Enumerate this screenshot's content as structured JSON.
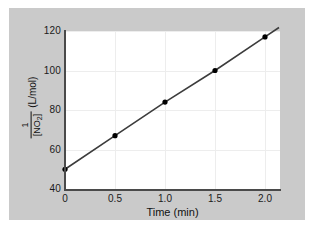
{
  "chart_data": {
    "type": "line",
    "title": "",
    "xlabel": "Time (min)",
    "ylabel_numerator": "1",
    "ylabel_denominator": "[NO",
    "ylabel_denominator_sub": "2",
    "ylabel_denominator_end": "]",
    "ylabel_units": "(L/mol)",
    "x": [
      0,
      0.5,
      1.0,
      1.5,
      2.0
    ],
    "values": [
      50,
      67,
      84,
      100,
      117
    ],
    "series": [
      {
        "name": "1/[NO2] vs time",
        "values": [
          50,
          67,
          84,
          100,
          117
        ]
      }
    ],
    "xlim": [
      0,
      2.15
    ],
    "ylim": [
      40,
      120
    ],
    "xticks": [
      "0",
      "0.5",
      "1.0",
      "1.5",
      "2.0"
    ],
    "xtick_values": [
      0,
      0.5,
      1.0,
      1.5,
      2.0
    ],
    "yticks": [
      "40",
      "60",
      "80",
      "100",
      "120"
    ],
    "ytick_values": [
      40,
      60,
      80,
      100,
      120
    ],
    "grid": true,
    "legend": "none",
    "marker": "filled-circle",
    "line_color": "#3c3c3c",
    "marker_color": "#000000",
    "plot_background": "#ffffff",
    "figure_background": "#c9c9c9"
  }
}
